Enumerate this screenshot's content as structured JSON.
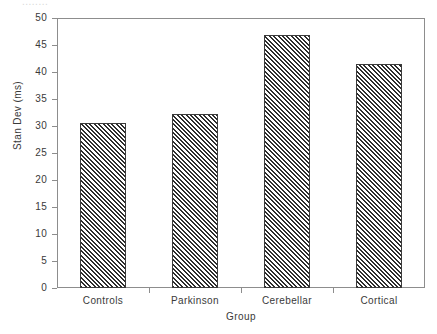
{
  "figure": {
    "clipped_header_text": "........",
    "background_color": "#ffffff",
    "frame_color": "#8d8d8d",
    "bar_edge_color": "#3c3c3c",
    "bar_hatch_color": "#2e2e2e",
    "bar_fill_color": "#ffffff"
  },
  "chart_data": {
    "type": "bar",
    "title": "",
    "subtitle": "",
    "xlabel": "Group",
    "ylabel": "Stan Dev (ms)",
    "categories": [
      "Controls",
      "Parkinson",
      "Cerebellar",
      "Cortical"
    ],
    "values": [
      30.6,
      32.2,
      46.8,
      41.4
    ],
    "series": [
      {
        "name": "Stan Dev (ms)",
        "values": [
          30.6,
          32.2,
          46.8,
          41.4
        ]
      }
    ],
    "ylim": [
      0,
      50
    ],
    "ytick_labels": [
      "0",
      "5",
      "10",
      "15",
      "20",
      "25",
      "30",
      "35",
      "40",
      "45",
      "50"
    ],
    "ytick_values": [
      0,
      5,
      10,
      15,
      20,
      25,
      30,
      35,
      40,
      45,
      50
    ],
    "xtick_labels": [
      "Controls",
      "Parkinson",
      "Cerebellar",
      "Cortical"
    ],
    "grid": false,
    "legend": false,
    "legend_position": "none",
    "bar_style": "diagonal-hatch",
    "annotations": []
  }
}
